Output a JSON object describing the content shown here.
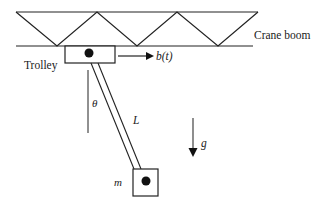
{
  "diagram": {
    "labels": {
      "crane_boom": "Crane boom",
      "trolley": "Trolley",
      "trolley_force": "b(t)",
      "angle": "θ",
      "length": "L",
      "gravity": "g",
      "mass": "m"
    },
    "colors": {
      "stroke": "#222222",
      "background": "#ffffff"
    }
  }
}
